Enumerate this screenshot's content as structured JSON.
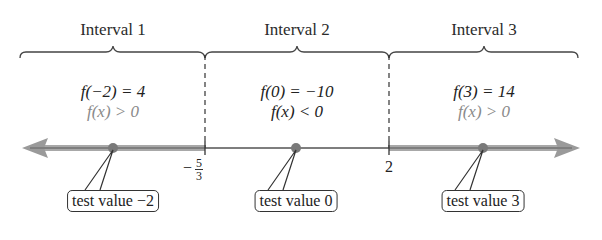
{
  "intervals": [
    {
      "title": "Interval 1",
      "evaluation": "f(−2) = 4",
      "sign": "f(x) > 0",
      "callout": "test value −2",
      "test_value": -2
    },
    {
      "title": "Interval 2",
      "evaluation": "f(0) = −10",
      "sign": "f(x) < 0",
      "callout": "test value 0",
      "test_value": 0
    },
    {
      "title": "Interval 3",
      "evaluation": "f(3) = 14",
      "sign": "f(x) > 0",
      "callout": "test value 3",
      "test_value": 3
    }
  ],
  "boundaries": [
    {
      "label_minus": "−",
      "label_num": "5",
      "label_den": "3",
      "value": "-5/3"
    },
    {
      "label": "2",
      "value": 2
    }
  ],
  "colors": {
    "positive_shading": "#9a9a9a",
    "point": "#7a7a7a",
    "line": "#333333",
    "sign_text": "#8a8a8a"
  }
}
